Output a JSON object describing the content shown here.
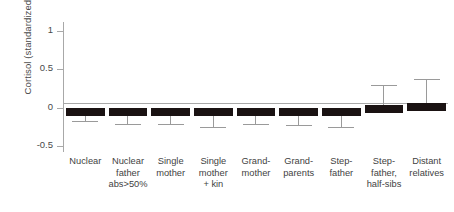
{
  "chart_data": {
    "type": "bar",
    "title": "",
    "xlabel": "",
    "ylabel": "Cortisol (standardized)",
    "ylim": [
      -0.58,
      1.12
    ],
    "yticks": [
      1,
      0.5,
      0,
      -0.5
    ],
    "ytick_labels": [
      "1",
      "0.5",
      "0",
      "-0.5"
    ],
    "grid": false,
    "legend": "none",
    "orientation": "vertical",
    "bar_color": "#1a1212",
    "error_color": "#9a9a9a",
    "axis_color": "#a8a8a8",
    "error_bar_type": "one-sided",
    "categories": [
      "Nuclear",
      "Nuclear father abs>50%",
      "Single mother",
      "Single mother + kin",
      "Grand-mother",
      "Grand-parents",
      "Step-father",
      "Step-father, half-sibs",
      "Distant relatives"
    ],
    "category_lines": [
      [
        "Nuclear"
      ],
      [
        "Nuclear",
        "father",
        "abs>50%"
      ],
      [
        "Single",
        "mother"
      ],
      [
        "Single",
        "mother",
        "+ kin"
      ],
      [
        "Grand-",
        "mother"
      ],
      [
        "Grand-",
        "parents"
      ],
      [
        "Step-",
        "father"
      ],
      [
        "Step-",
        "father,",
        "half-sibs"
      ],
      [
        "Distant",
        "relatives"
      ]
    ],
    "values": [
      -0.05,
      -0.05,
      -0.06,
      -0.06,
      -0.08,
      -0.06,
      -0.04,
      0.03,
      0.06
    ],
    "errors": [
      -0.18,
      -0.22,
      -0.22,
      -0.25,
      -0.21,
      -0.23,
      -0.25,
      0.3,
      0.38
    ],
    "series": [
      {
        "name": "Cortisol (standardized)",
        "values": [
          -0.05,
          -0.05,
          -0.06,
          -0.06,
          -0.08,
          -0.06,
          -0.04,
          0.03,
          0.06
        ],
        "error_extent": [
          -0.18,
          -0.22,
          -0.22,
          -0.25,
          -0.21,
          -0.23,
          -0.25,
          0.3,
          0.38
        ]
      }
    ]
  }
}
